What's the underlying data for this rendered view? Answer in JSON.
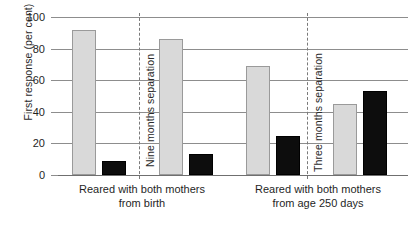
{
  "chart_data": {
    "type": "bar",
    "title": "",
    "xlabel": "",
    "ylabel": "First response (per cent)",
    "ylim": [
      0,
      100
    ],
    "yticks": [
      0,
      20,
      40,
      60,
      80,
      100
    ],
    "grid": true,
    "legend": "none",
    "categories": [
      "Reared with both mothers from birth / Nine months separation - before",
      "Reared with both mothers from birth / Nine months separation - after",
      "Reared with both mothers from age 250 days / Three months separation - before",
      "Reared with both mothers from age 250 days / Three months separation - after"
    ],
    "series": [
      {
        "name": "light-bar",
        "values": [
          92,
          86,
          69,
          45
        ]
      },
      {
        "name": "dark-bar",
        "values": [
          9,
          13,
          25,
          53
        ]
      }
    ],
    "bars": [
      {
        "value": 92,
        "fill": "light"
      },
      {
        "value": 9,
        "fill": "dark"
      },
      {
        "value": 86,
        "fill": "light"
      },
      {
        "value": 13,
        "fill": "dark"
      },
      {
        "value": 69,
        "fill": "light"
      },
      {
        "value": 25,
        "fill": "dark"
      },
      {
        "value": 45,
        "fill": "light"
      },
      {
        "value": 53,
        "fill": "dark"
      }
    ],
    "separators": [
      {
        "label": "Nine months separation"
      },
      {
        "label": "Three months separation"
      }
    ],
    "group_labels": [
      {
        "line1": "Reared with both mothers",
        "line2": "from birth"
      },
      {
        "line1": "Reared with both mothers",
        "line2": "from age 250 days"
      }
    ],
    "colors": {
      "light_bar": "#d9d9d9",
      "light_bar_border": "#9a9a9a",
      "dark_bar": "#0d0d0d",
      "gridline": "#8d8d8d",
      "text": "#1f1f1f",
      "background": "#ffffff"
    }
  },
  "axis": {
    "y_title": "First response (per cent)",
    "y_ticks": {
      "t0": "0",
      "t20": "20",
      "t40": "40",
      "t60": "60",
      "t80": "80",
      "t100": "100"
    }
  },
  "separators": {
    "nine": "Nine months separation",
    "three": "Three months separation"
  },
  "groups": {
    "left_line1": "Reared with both mothers",
    "left_line2": "from birth",
    "right_line1": "Reared with both mothers",
    "right_line2": "from age 250 days"
  }
}
